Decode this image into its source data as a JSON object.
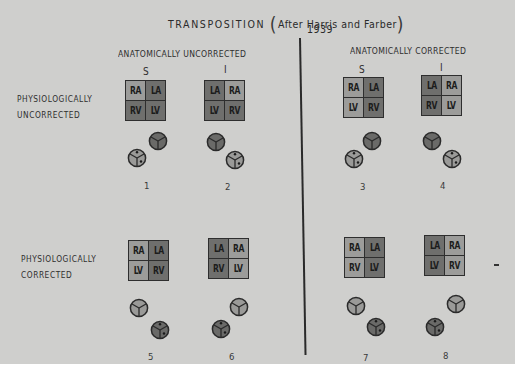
{
  "title": {
    "main": "TRANSPOSITION",
    "attribution": "After Harris and Farber",
    "year": "1939",
    "open_paren": "(",
    "close_paren": ")"
  },
  "column_groups": [
    {
      "label": "ANATOMICALLY UNCORRECTED",
      "sub_columns": [
        "S",
        "I"
      ]
    },
    {
      "label": "ANATOMICALLY CORRECTED",
      "sub_columns": [
        "S",
        "I"
      ]
    }
  ],
  "row_labels": [
    {
      "line1": "PHYSIOLOGICALLY",
      "line2": "UNCORRECTED"
    },
    {
      "line1": "PHYSIOLOGICALLY",
      "line2": "CORRECTED"
    }
  ],
  "colors": {
    "background": "#cfcfcd",
    "atrium_light": "#9c9c9a",
    "chamber_dark": "#6f6f6d",
    "outline": "#2e2e2e"
  },
  "diagrams": [
    {
      "number": "1",
      "cells": [
        {
          "t": "RA",
          "shade": "light"
        },
        {
          "t": "LA",
          "shade": "dark"
        },
        {
          "t": "RV",
          "shade": "dark"
        },
        {
          "t": "LV",
          "shade": "dark"
        }
      ],
      "vessels": {
        "dark": "upper-right",
        "light_dotted": "lower-left"
      }
    },
    {
      "number": "2",
      "cells": [
        {
          "t": "LA",
          "shade": "dark"
        },
        {
          "t": "RA",
          "shade": "light"
        },
        {
          "t": "LV",
          "shade": "dark"
        },
        {
          "t": "RV",
          "shade": "dark"
        }
      ],
      "vessels": {
        "dark": "upper-left",
        "light_dotted": "lower-right"
      }
    },
    {
      "number": "3",
      "cells": [
        {
          "t": "RA",
          "shade": "light"
        },
        {
          "t": "LA",
          "shade": "dark"
        },
        {
          "t": "LV",
          "shade": "light"
        },
        {
          "t": "RV",
          "shade": "dark"
        }
      ],
      "vessels": {
        "dark": "upper-right",
        "light_dotted": "lower-left"
      }
    },
    {
      "number": "4",
      "cells": [
        {
          "t": "LA",
          "shade": "dark"
        },
        {
          "t": "RA",
          "shade": "light"
        },
        {
          "t": "RV",
          "shade": "dark"
        },
        {
          "t": "LV",
          "shade": "light"
        }
      ],
      "vessels": {
        "dark": "upper-left",
        "light_dotted": "lower-right"
      }
    },
    {
      "number": "5",
      "cells": [
        {
          "t": "RA",
          "shade": "light"
        },
        {
          "t": "LA",
          "shade": "dark"
        },
        {
          "t": "LV",
          "shade": "light"
        },
        {
          "t": "RV",
          "shade": "dark"
        }
      ],
      "vessels": {
        "light": "upper-left",
        "dark_dotted": "lower-right"
      }
    },
    {
      "number": "6",
      "cells": [
        {
          "t": "LA",
          "shade": "dark"
        },
        {
          "t": "RA",
          "shade": "light"
        },
        {
          "t": "RV",
          "shade": "dark"
        },
        {
          "t": "LV",
          "shade": "light"
        }
      ],
      "vessels": {
        "light": "upper-right",
        "dark_dotted": "lower-left"
      }
    },
    {
      "number": "7",
      "cells": [
        {
          "t": "RA",
          "shade": "light"
        },
        {
          "t": "LA",
          "shade": "dark"
        },
        {
          "t": "RV",
          "shade": "light"
        },
        {
          "t": "LV",
          "shade": "dark"
        }
      ],
      "vessels": {
        "light": "upper-left",
        "dark_dotted": "lower-right"
      }
    },
    {
      "number": "8",
      "cells": [
        {
          "t": "LA",
          "shade": "dark"
        },
        {
          "t": "RA",
          "shade": "light"
        },
        {
          "t": "LV",
          "shade": "dark"
        },
        {
          "t": "RV",
          "shade": "light"
        }
      ],
      "vessels": {
        "light": "upper-right",
        "dark_dotted": "lower-left"
      }
    }
  ]
}
